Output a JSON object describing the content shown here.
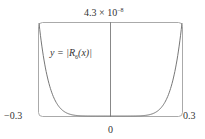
{
  "chart_data": {
    "type": "line",
    "title": "",
    "xlabel": "",
    "ylabel": "",
    "xlim": [
      -0.3,
      0.3
    ],
    "ylim": [
      0,
      4.3e-08
    ],
    "x_tick_labels": [
      "-0.3",
      "0",
      "0.3"
    ],
    "y_tick_labels": [
      "4.3 × 10^-8"
    ],
    "grid": false,
    "legend": null,
    "annotations": [
      "y = |R_6(x)|"
    ],
    "series": [
      {
        "name": "y = |R_6(x)|",
        "x": [
          -0.3,
          -0.28,
          -0.26,
          -0.24,
          -0.22,
          -0.2,
          -0.18,
          -0.15,
          -0.1,
          -0.05,
          0,
          0.05,
          0.1,
          0.15,
          0.18,
          0.2,
          0.22,
          0.24,
          0.26,
          0.28,
          0.3
        ],
        "y": [
          4.3e-08,
          2.6e-08,
          1.5e-08,
          8.5e-09,
          4.5e-09,
          2.3e-09,
          1.1e-09,
          3.5e-10,
          3e-11,
          1e-12,
          0,
          1e-12,
          3e-11,
          3.5e-10,
          1.1e-09,
          2.3e-09,
          4.5e-09,
          8.5e-09,
          1.5e-08,
          2.6e-08,
          4.3e-08
        ]
      }
    ]
  },
  "labels": {
    "y_max": "4.3 × 10",
    "y_max_exp": "−8",
    "x_min": "−0.3",
    "x_max": "0.3",
    "x_zero": "0",
    "fn_prefix": "y = |R",
    "fn_sub": "6",
    "fn_suffix": "(x)|"
  }
}
